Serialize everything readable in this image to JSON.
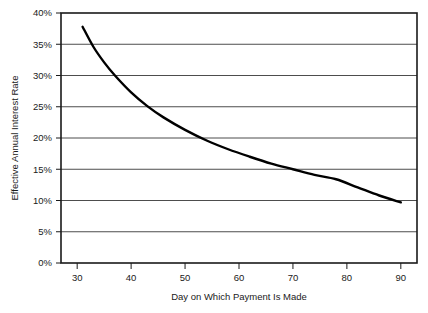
{
  "chart_data": {
    "type": "line",
    "title": "",
    "xlabel": "Day on Which Payment Is Made",
    "ylabel": "Effective Annual Interest Rate",
    "xlim": [
      27,
      93
    ],
    "ylim": [
      0,
      40
    ],
    "xticks": [
      30,
      40,
      50,
      60,
      70,
      80,
      90
    ],
    "xticklabels": [
      "30",
      "40",
      "50",
      "60",
      "70",
      "80",
      "90"
    ],
    "yticks": [
      0,
      5,
      10,
      15,
      20,
      25,
      30,
      35,
      40
    ],
    "yticklabels": [
      "0%",
      "5%",
      "10%",
      "15%",
      "20%",
      "25%",
      "30%",
      "35%",
      "40%"
    ],
    "grid": "horizontal",
    "legend": "none",
    "series": [
      {
        "name": "Effective annual interest rate",
        "x": [
          31,
          33,
          35,
          37,
          40,
          43,
          46,
          50,
          54,
          58,
          62,
          66,
          70,
          74,
          78,
          82,
          86,
          90
        ],
        "y": [
          37.8,
          34.6,
          32.1,
          30.0,
          27.3,
          25.1,
          23.3,
          21.3,
          19.6,
          18.2,
          17.0,
          15.9,
          15.0,
          14.1,
          13.4,
          12.1,
          10.8,
          9.7
        ]
      }
    ],
    "colors": {
      "curve": "#000000",
      "gridline": "#4d4d4d",
      "axis": "#1a1a1a",
      "background": "#ffffff",
      "text": "#1a1a1a"
    }
  }
}
